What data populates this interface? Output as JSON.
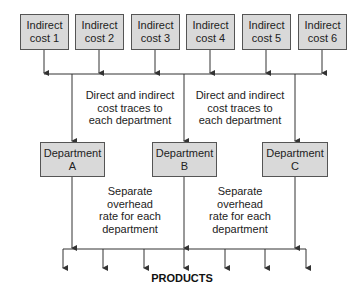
{
  "diagram": {
    "indirect_costs": [
      {
        "line1": "Indirect",
        "line2": "cost 1"
      },
      {
        "line1": "Indirect",
        "line2": "cost 2"
      },
      {
        "line1": "Indirect",
        "line2": "cost 3"
      },
      {
        "line1": "Indirect",
        "line2": "cost 4"
      },
      {
        "line1": "Indirect",
        "line2": "cost 5"
      },
      {
        "line1": "Indirect",
        "line2": "cost 6"
      }
    ],
    "trace_notes": [
      {
        "lines": [
          "Direct and indirect",
          "cost traces to",
          "each department"
        ]
      },
      {
        "lines": [
          "Direct and indirect",
          "cost traces to",
          "each department"
        ]
      }
    ],
    "departments": [
      {
        "line1": "Department",
        "line2": "A"
      },
      {
        "line1": "Department",
        "line2": "B"
      },
      {
        "line1": "Department",
        "line2": "C"
      }
    ],
    "rate_notes": [
      {
        "lines": [
          "Separate",
          "overhead",
          "rate for each",
          "department"
        ]
      },
      {
        "lines": [
          "Separate",
          "overhead",
          "rate for each",
          "department"
        ]
      }
    ],
    "output_label": "PRODUCTS",
    "colors": {
      "box_fill": "#d9d9d9",
      "box_border": "#555555",
      "line": "#333333"
    }
  }
}
